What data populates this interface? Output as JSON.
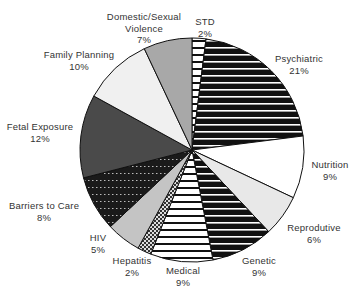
{
  "chart_data": {
    "type": "pie",
    "title": "",
    "start_angle_deg": 0,
    "direction": "clockwise",
    "center": [
      192,
      150
    ],
    "radius": 112,
    "slices": [
      {
        "label": "STD",
        "value": 2,
        "pct_label": "2%",
        "fill": "hstripe-white",
        "label_pos": [
          205,
          16
        ],
        "label_lines": [
          "STD",
          "2%"
        ]
      },
      {
        "label": "Psychiatric",
        "value": 21,
        "pct_label": "21%",
        "fill": "hstripe-black",
        "label_pos": [
          299,
          53
        ],
        "label_lines": [
          "Psychiatric",
          "21%"
        ]
      },
      {
        "label": "Nutrition",
        "value": 9,
        "pct_label": "9%",
        "fill": "#ffffff",
        "label_pos": [
          330,
          159
        ],
        "label_lines": [
          "Nutrition",
          "9%"
        ]
      },
      {
        "label": "Reproductive",
        "value": 6,
        "pct_label": "6%",
        "fill": "#e8e8e8",
        "label_pos": [
          314,
          222
        ],
        "label_lines": [
          "Reprodutive",
          "6%"
        ]
      },
      {
        "label": "Genetic",
        "value": 9,
        "pct_label": "9%",
        "fill": "hstripe-black",
        "label_pos": [
          259,
          255
        ],
        "label_lines": [
          "Genetic",
          "9%"
        ]
      },
      {
        "label": "Medical",
        "value": 9,
        "pct_label": "9%",
        "fill": "hstripe-white",
        "label_pos": [
          183,
          265
        ],
        "label_lines": [
          "Medical",
          "9%"
        ]
      },
      {
        "label": "Hepatitis",
        "value": 2,
        "pct_label": "2%",
        "fill": "checker",
        "label_pos": [
          132,
          255
        ],
        "label_lines": [
          "Hepatitis",
          "2%"
        ]
      },
      {
        "label": "HIV",
        "value": 5,
        "pct_label": "5%",
        "fill": "#c4c4c4",
        "label_pos": [
          98,
          232
        ],
        "label_lines": [
          "HIV",
          "5%"
        ]
      },
      {
        "label": "Barriers to Care",
        "value": 8,
        "pct_label": "8%",
        "fill": "dotted-black",
        "label_pos": [
          44,
          200
        ],
        "label_lines": [
          "Barriers to Care",
          "8%"
        ]
      },
      {
        "label": "Fetal Exposure",
        "value": 12,
        "pct_label": "12%",
        "fill": "#4a4a4a",
        "label_pos": [
          40,
          121
        ],
        "label_lines": [
          "Fetal Exposure",
          "12%"
        ]
      },
      {
        "label": "Family Planning",
        "value": 10,
        "pct_label": "10%",
        "fill": "#f0f0f0",
        "label_pos": [
          79,
          49
        ],
        "label_lines": [
          "Family Planning",
          "10%"
        ]
      },
      {
        "label": "Domestic/Sexual Violence",
        "value": 7,
        "pct_label": "7%",
        "fill": "#a8a8a8",
        "label_pos": [
          144,
          11
        ],
        "label_lines": [
          "Domestic/Sexual",
          "Violence",
          "7%"
        ]
      }
    ],
    "legend": "none"
  }
}
